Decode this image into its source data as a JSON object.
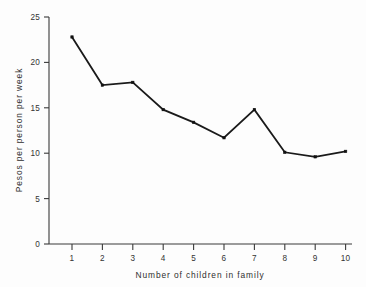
{
  "chart_data": {
    "type": "line",
    "title": "",
    "subtitle": "",
    "xlabel": "Number of children in family",
    "ylabel": "Pesos per person per week",
    "x": [
      1,
      2,
      3,
      4,
      5,
      6,
      7,
      8,
      9,
      10
    ],
    "values": [
      22.8,
      17.5,
      17.8,
      14.8,
      13.4,
      11.7,
      14.8,
      10.1,
      9.6,
      10.2
    ],
    "categories": [
      "1",
      "2",
      "3",
      "4",
      "5",
      "6",
      "7",
      "8",
      "9",
      "10"
    ],
    "xtick_labels": [
      "1",
      "2",
      "3",
      "4",
      "5",
      "6",
      "7",
      "8",
      "9",
      "10"
    ],
    "ytick_labels": [
      "0",
      "5",
      "10",
      "15",
      "20",
      "25"
    ],
    "ytick_values": [
      0,
      5,
      10,
      15,
      20,
      25
    ],
    "xlim": [
      0.45,
      10.55
    ],
    "ylim": [
      0,
      25
    ],
    "grid": false,
    "legend": false,
    "legend_position": "none",
    "marker": "filled-square",
    "line_color": "#111111",
    "axis_color": "#3a3a3a",
    "background_color": "#fdfdfd"
  }
}
